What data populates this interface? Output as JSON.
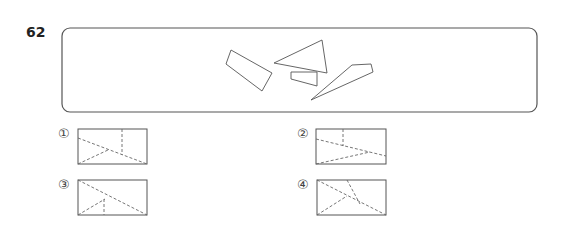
{
  "question": {
    "number": "62"
  },
  "problem_box": {
    "x": 62,
    "y": 28,
    "w": 475,
    "h": 84,
    "radius": 8,
    "pieces": [
      {
        "name": "quadrilateral-piece",
        "points": "231,50 226,64 262,91 272,73"
      },
      {
        "name": "triangle-piece",
        "points": "274,63 322,40 327,73"
      },
      {
        "name": "small-quad-piece",
        "points": "291,72 317,72 317,86 291,79"
      },
      {
        "name": "long-kite-piece",
        "points": "311,100 352,65 371,64 373,72"
      }
    ]
  },
  "options": [
    {
      "label": "①",
      "label_pos": [
        58,
        126
      ],
      "rect": {
        "x": 78,
        "y": 129,
        "w": 69,
        "h": 35
      },
      "dashes": [
        [
          78,
          138,
          147,
          164
        ],
        [
          78,
          164,
          108,
          150
        ],
        [
          122,
          129,
          122,
          155
        ]
      ]
    },
    {
      "label": "②",
      "label_pos": [
        297,
        126
      ],
      "rect": {
        "x": 316,
        "y": 129,
        "w": 70,
        "h": 35
      },
      "dashes": [
        [
          316,
          139,
          386,
          156
        ],
        [
          316,
          164,
          370,
          152
        ],
        [
          343,
          129,
          343,
          146
        ]
      ]
    },
    {
      "label": "③",
      "label_pos": [
        58,
        177
      ],
      "rect": {
        "x": 78,
        "y": 180,
        "w": 69,
        "h": 35
      },
      "dashes": [
        [
          78,
          180,
          147,
          215
        ],
        [
          78,
          215,
          105,
          199
        ],
        [
          104,
          199,
          104,
          215
        ]
      ]
    },
    {
      "label": "④",
      "label_pos": [
        297,
        177
      ],
      "rect": {
        "x": 317,
        "y": 180,
        "w": 69,
        "h": 35
      },
      "dashes": [
        [
          317,
          180,
          386,
          215
        ],
        [
          317,
          215,
          347,
          196
        ],
        [
          347,
          180,
          360,
          204
        ]
      ]
    }
  ],
  "colors": {
    "stroke": "#555555",
    "dash": "#666666"
  }
}
